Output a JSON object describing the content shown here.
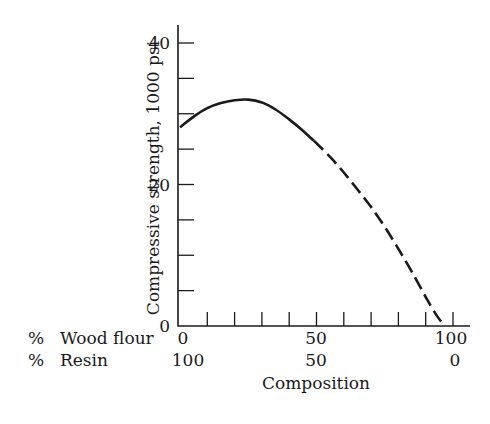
{
  "chart_data": {
    "type": "line",
    "title": "",
    "ylabel": "Compressive strength, 1000 psi",
    "xlabel": "Composition",
    "x_row_labels": [
      {
        "label": "% Wood flour",
        "percent_sign": "%",
        "text": "Wood flour",
        "ticks": [
          "0",
          "50",
          "100"
        ]
      },
      {
        "label": "% Resin",
        "percent_sign": "%",
        "text": "Resin",
        "ticks": [
          "100",
          "50",
          "0"
        ]
      }
    ],
    "xlim": [
      0,
      100
    ],
    "ylim": [
      0,
      40
    ],
    "x_major_ticks": [
      0,
      50,
      100
    ],
    "x_minor_ticks": [
      10,
      20,
      30,
      40,
      60,
      70,
      80,
      90
    ],
    "y_ticks": [
      0,
      5,
      10,
      15,
      20,
      25,
      30,
      35,
      40
    ],
    "y_tick_labels": [
      {
        "value": 0,
        "label": "0"
      },
      {
        "value": 20,
        "label": "20"
      },
      {
        "value": 40,
        "label": "40"
      }
    ],
    "grid": false,
    "series": [
      {
        "name": "measured",
        "style": "solid",
        "x": [
          0,
          5,
          10,
          15,
          20,
          25,
          30,
          35,
          40,
          45,
          49
        ],
        "y": [
          28.1,
          29.6,
          30.8,
          31.5,
          31.9,
          32.0,
          31.6,
          30.6,
          29.2,
          27.6,
          26.2
        ]
      },
      {
        "name": "extrapolated",
        "style": "dashed",
        "x": [
          49,
          55,
          60,
          65,
          70,
          75,
          80,
          85,
          90,
          94,
          97
        ],
        "y": [
          26.2,
          23.9,
          21.7,
          19.3,
          16.8,
          14.0,
          10.9,
          7.6,
          4.1,
          1.5,
          0
        ]
      }
    ],
    "colors": {
      "ink": "#1a1a1a",
      "background": "#ffffff"
    }
  }
}
